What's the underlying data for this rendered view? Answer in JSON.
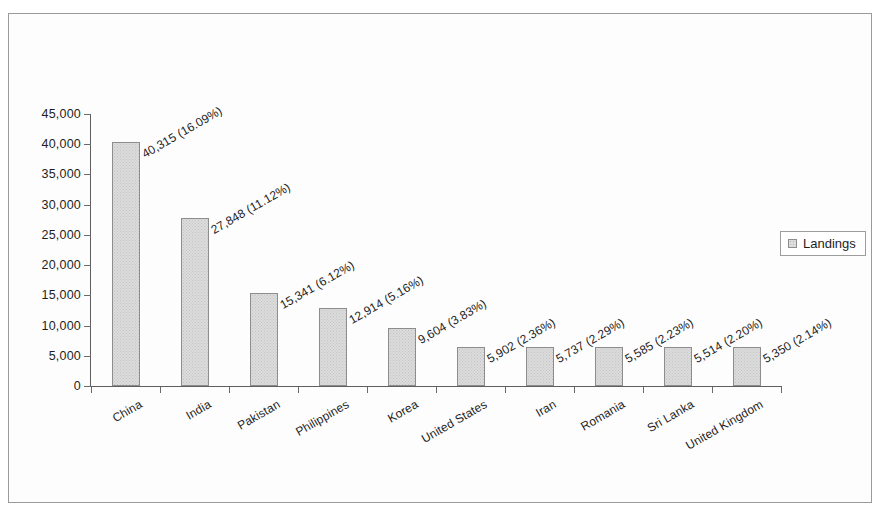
{
  "chart_data": {
    "type": "bar",
    "title": "",
    "xlabel": "",
    "ylabel": "",
    "ylim": [
      0,
      45000
    ],
    "ytick_step": 5000,
    "grid": false,
    "legend_position": "right",
    "series_name": "Landings",
    "categories": [
      "China",
      "India",
      "Pakistan",
      "Philippines",
      "Korea",
      "United States",
      "Iran",
      "Romania",
      "Sri Lanka",
      "United Kingdom"
    ],
    "values": [
      40315,
      27848,
      15341,
      12914,
      9604,
      5902,
      5737,
      5585,
      5514,
      5350
    ],
    "percents": [
      "16.09%",
      "11.12%",
      "6.12%",
      "5.16%",
      "3.83%",
      "2.36%",
      "2.29%",
      "2.23%",
      "2.20%",
      "2.14%"
    ],
    "point_labels": [
      "40,315 (16.09%)",
      "27,848 (11.12%)",
      "15,341 (6.12%)",
      "12,914 (5.16%)",
      "9,604 (3.83%)",
      "5,902 (2.36%)",
      "5,737 (2.29%)",
      "5,585 (2.23%)",
      "5,514 (2.20%)",
      "5,350 (2.14%)"
    ],
    "ytick_labels": [
      "45,000",
      "40,000",
      "35,000",
      "30,000",
      "25,000",
      "20,000",
      "15,000",
      "10,000",
      "5,000",
      "0"
    ],
    "ytick_values": [
      45000,
      40000,
      35000,
      30000,
      25000,
      20000,
      15000,
      10000,
      5000,
      0
    ],
    "bar_fill_color": "#dcdcdc",
    "bar_border_color": "#8d8d8d",
    "axis_color": "#5f5f5f",
    "frame_color": "#9a9a9a",
    "text_color": "#1d1d1d"
  },
  "legend": {
    "swatch_name": "landings-swatch",
    "label": "Landings"
  }
}
